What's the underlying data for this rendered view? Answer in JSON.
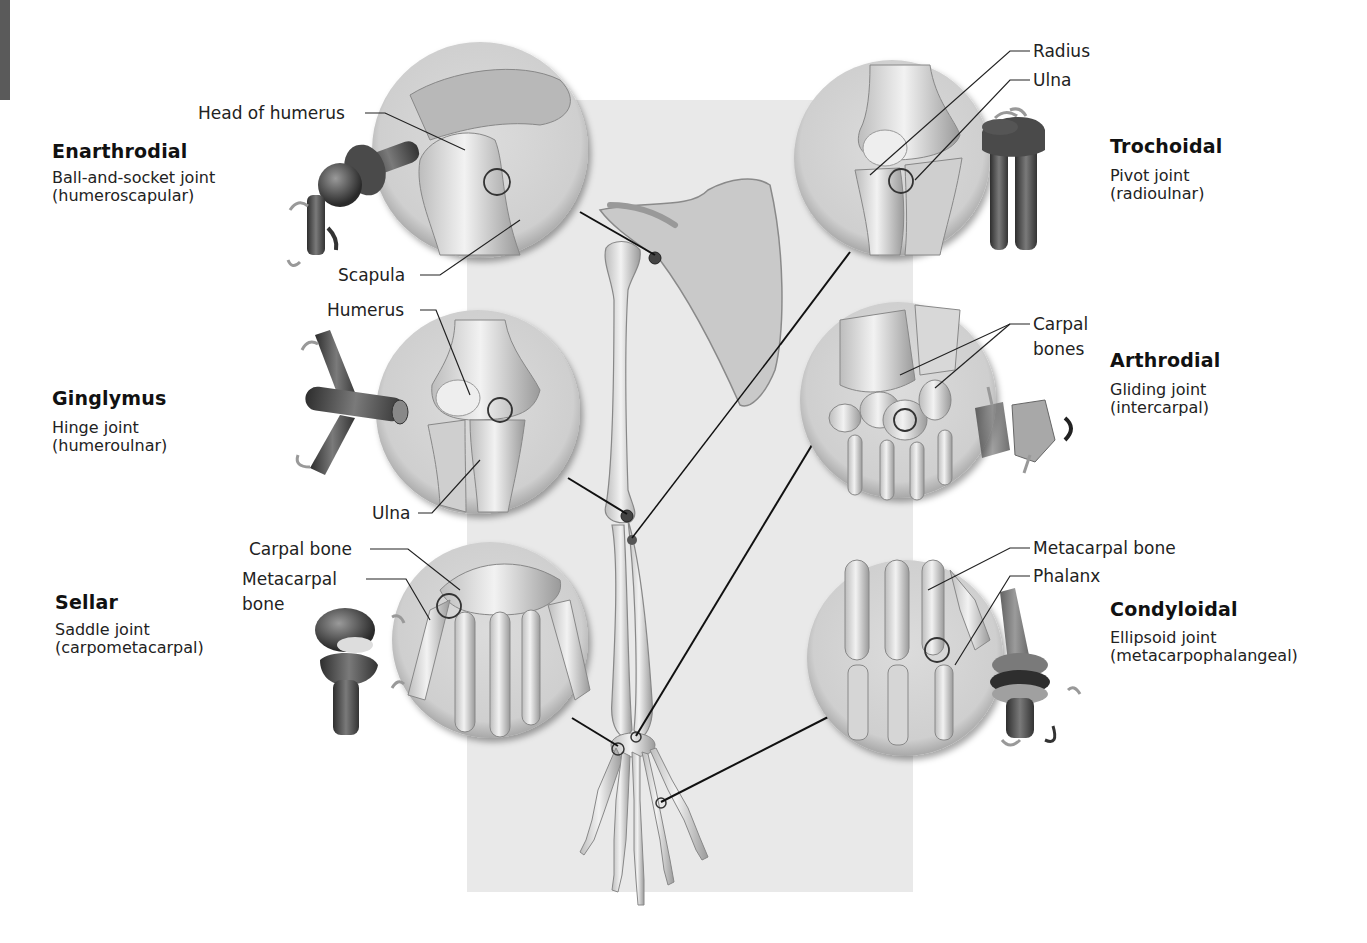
{
  "figure": {
    "center_illustration": "skeleton-of-right-upper-limb-with-scapula",
    "background_panel_color": "#e9e9e9",
    "edge_tab_color": "#5a5a5a"
  },
  "joints": [
    {
      "id": "enarthrodial",
      "title": "Enarthrodial",
      "type": "Ball-and-socket joint",
      "example": "(humeroscapular)",
      "labels": [
        "Head of humerus",
        "Scapula"
      ],
      "model_icon": "ball-and-socket-model-icon"
    },
    {
      "id": "ginglymus",
      "title": "Ginglymus",
      "type": "Hinge joint",
      "example": "(humeroulnar)",
      "labels": [
        "Humerus",
        "Ulna"
      ],
      "model_icon": "hinge-model-icon"
    },
    {
      "id": "sellar",
      "title": "Sellar",
      "type": "Saddle joint",
      "example": "(carpometacarpal)",
      "labels": [
        "Carpal bone",
        "Metacarpal",
        "bone"
      ],
      "model_icon": "saddle-model-icon"
    },
    {
      "id": "trochoidal",
      "title": "Trochoidal",
      "type": "Pivot joint",
      "example": "(radioulnar)",
      "labels": [
        "Radius",
        "Ulna"
      ],
      "model_icon": "pivot-model-icon"
    },
    {
      "id": "arthrodial",
      "title": "Arthrodial",
      "type": "Gliding joint",
      "example": "(intercarpal)",
      "labels": [
        "Carpal",
        "bones"
      ],
      "model_icon": "gliding-model-icon"
    },
    {
      "id": "condyloidal",
      "title": "Condyloidal",
      "type": "Ellipsoid joint",
      "example": "(metacarpophalangeal)",
      "labels": [
        "Metacarpal bone",
        "Phalanx"
      ],
      "model_icon": "ellipsoid-model-icon"
    }
  ]
}
